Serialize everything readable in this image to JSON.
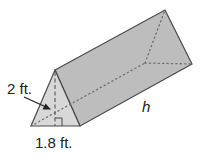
{
  "figure": {
    "type": "triangular-prism",
    "labels": {
      "height_of_triangle": "2 ft.",
      "base_of_triangle": "1.8 ft.",
      "prism_length": "h"
    },
    "colors": {
      "front_face": "#d6d6d6",
      "side_face": "#bdbdbd",
      "top_face": "#c8c8c8",
      "edge": "#4a4a4a",
      "hidden_edge": "#7a7a7a",
      "text": "#222222"
    }
  }
}
